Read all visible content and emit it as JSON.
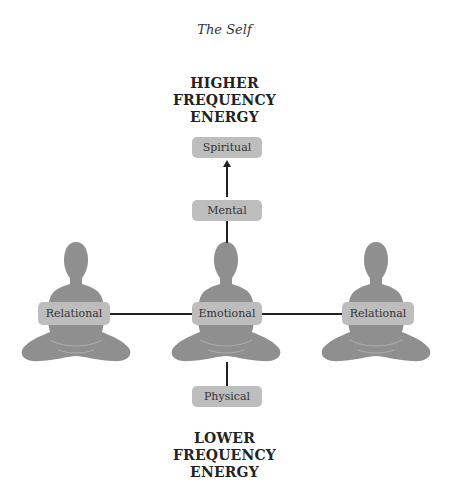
{
  "title": "The Self",
  "top_label": {
    "lines": [
      "HIGHER",
      "FREQUENCY",
      "ENERGY"
    ]
  },
  "bottom_label": {
    "lines": [
      "LOWER",
      "FREQUENCY",
      "ENERGY"
    ]
  },
  "nodes": {
    "spiritual": "Spiritual",
    "mental": "Mental",
    "emotional": "Emotional",
    "relational_left": "Relational",
    "relational_right": "Relational",
    "physical": "Physical"
  },
  "colors": {
    "box_fill": "#bdbdbd",
    "figure_fill": "#8f8f8f",
    "line": "#222222"
  }
}
